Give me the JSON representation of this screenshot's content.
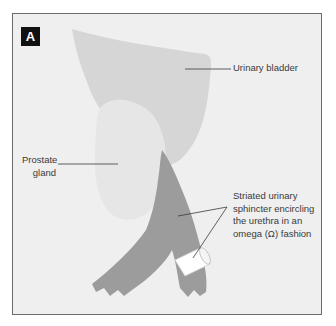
{
  "figure": {
    "panel_label": "A",
    "labels": {
      "urinary_bladder": "Urinary bladder",
      "prostate_line1": "Prostate",
      "prostate_line2": "gland",
      "sphincter_line1": "Striated urinary",
      "sphincter_line2": "sphincter encircling",
      "sphincter_line3": "the urethra in an",
      "sphincter_line4": "omega (Ω) fashion"
    },
    "colors": {
      "background": "#efefef",
      "bladder": "#d6d6d6",
      "prostate": "#e6e6e6",
      "sphincter": "#9c9c9c",
      "urethra": "#ffffff",
      "leader_line": "#3a3a3a"
    }
  }
}
